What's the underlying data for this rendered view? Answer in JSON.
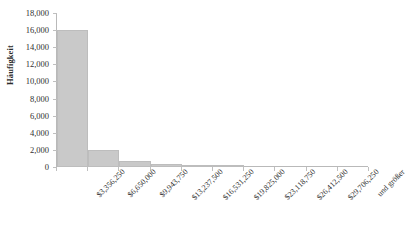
{
  "chart_data": {
    "type": "bar",
    "title": "",
    "subtitle": "",
    "xlabel": "",
    "ylabel": "Häufigkeit",
    "categories": [
      "$3,356,250",
      "$6,650,000",
      "$9,943,750",
      "$13,237,500",
      "$16,531,250",
      "$19,825,000",
      "$23,118,750",
      "$26,412,500",
      "$29,706,250",
      "und größer"
    ],
    "values": [
      16000,
      2000,
      750,
      400,
      200,
      60,
      0,
      0,
      0,
      0
    ],
    "ylim": [
      0,
      18000
    ],
    "ytick_labels": [
      "18,000",
      "16,000",
      "14,000",
      "12,000",
      "10,000",
      "8,000",
      "6,000",
      "4,000",
      "2,000",
      "0"
    ],
    "ytick_values": [
      18000,
      16000,
      14000,
      12000,
      10000,
      8000,
      6000,
      4000,
      2000,
      0
    ],
    "ytick_step": 2000,
    "grid": false,
    "legend": false,
    "legend_position": "none",
    "bar_color": "#c9c9c9",
    "bar_edge_color": "#bdbdbd",
    "axis_color": "#b9b9b9",
    "text_color": "#2f2f2f",
    "background": "#ffffff",
    "xtick_label_rotation": -45
  }
}
